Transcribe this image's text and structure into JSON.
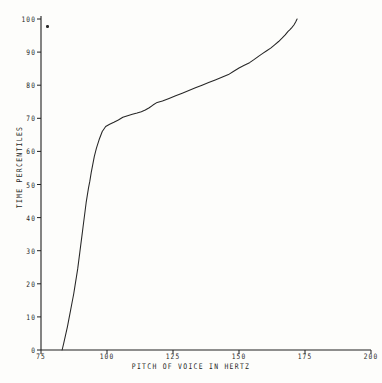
{
  "chart_data": {
    "type": "line",
    "title": "",
    "xlabel": "PITCH OF VOICE IN HERTZ",
    "ylabel": "TIME PERCENTILES",
    "xlim": [
      75,
      200
    ],
    "ylim": [
      0,
      100
    ],
    "xticks": [
      75,
      100,
      125,
      150,
      175,
      200
    ],
    "xtick_labels": [
      "75",
      "100",
      "125",
      "150",
      "175",
      "200"
    ],
    "yticks": [
      0,
      10,
      20,
      30,
      40,
      50,
      60,
      70,
      80,
      90,
      100
    ],
    "ytick_labels": [
      "0",
      "10",
      "20",
      "30",
      "40",
      "50",
      "60",
      "70",
      "80",
      "90",
      "100"
    ],
    "grid": false,
    "legend": false,
    "series": [
      {
        "name": "cumulative pitch distribution",
        "x": [
          83.0,
          83.6,
          84.3,
          85.0,
          85.6,
          86.2,
          86.8,
          87.4,
          87.9,
          88.4,
          88.9,
          89.3,
          89.7,
          90.1,
          90.5,
          90.9,
          91.3,
          91.7,
          92.1,
          92.6,
          93.0,
          93.5,
          94.0,
          94.6,
          95.2,
          96.0,
          97.0,
          98.2,
          99.5,
          101.0,
          102.6,
          104.3,
          106.0,
          107.8,
          109.6,
          111.4,
          113.0,
          114.5,
          116.0,
          117.4,
          119.0,
          121.0,
          123.5,
          126.0,
          128.5,
          131.0,
          133.5,
          136.0,
          138.5,
          141.0,
          143.5,
          146.0,
          148.0,
          150.0,
          152.0,
          154.0,
          155.8,
          157.5,
          159.0,
          160.5,
          162.0,
          163.5,
          165.0,
          166.3,
          167.5,
          168.5,
          169.3,
          170.0,
          170.8,
          171.5,
          172.0
        ],
        "y": [
          0.0,
          2.0,
          4.5,
          7.0,
          9.5,
          12.0,
          14.5,
          17.0,
          19.5,
          22.0,
          24.5,
          27.0,
          29.5,
          32.0,
          34.5,
          37.0,
          39.5,
          42.0,
          44.5,
          47.0,
          49.0,
          51.0,
          53.5,
          56.0,
          58.5,
          61.0,
          63.5,
          66.0,
          67.5,
          68.2,
          68.8,
          69.5,
          70.3,
          70.8,
          71.2,
          71.6,
          72.0,
          72.5,
          73.2,
          74.0,
          74.8,
          75.2,
          76.0,
          76.8,
          77.6,
          78.4,
          79.2,
          80.0,
          80.8,
          81.6,
          82.4,
          83.2,
          84.2,
          85.2,
          86.0,
          86.8,
          87.8,
          88.8,
          89.6,
          90.4,
          91.2,
          92.2,
          93.2,
          94.2,
          95.2,
          96.2,
          96.8,
          97.4,
          98.2,
          99.2,
          100.0
        ]
      }
    ]
  },
  "axes": {
    "x_title": "PITCH OF VOICE IN HERTZ",
    "y_title": "TIME PERCENTILES"
  },
  "marks": {
    "speck_label": "ink-speck"
  }
}
